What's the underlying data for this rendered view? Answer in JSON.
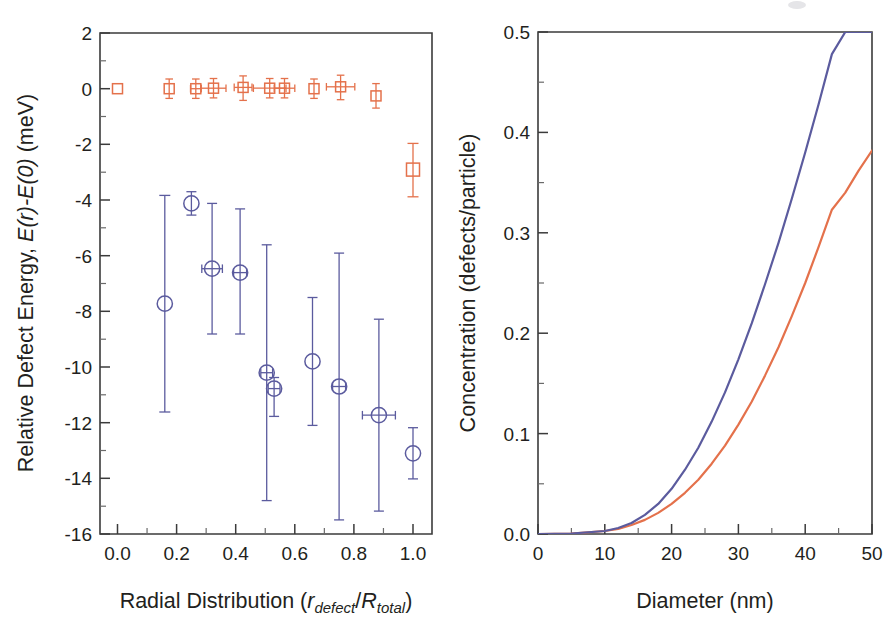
{
  "figure": {
    "panels": [
      "left",
      "right"
    ],
    "background": "#ffffff",
    "colors": {
      "blue": "#5b5b9e",
      "orange": "#e4714b",
      "axis": "#3b3b3b",
      "text": "#231f20"
    }
  },
  "left_panel": {
    "y_title_parts": {
      "a": "Relative Defect Energy, ",
      "b": "E(r)-E(0)",
      "c": " (meV)"
    },
    "x_title_parts": {
      "a": "Radial Distribution (",
      "b": "r",
      "b_sub": "defect",
      "c": "/",
      "d": "R",
      "d_sub": "total",
      "e": ")"
    },
    "y_ticks": [
      "2",
      "0",
      "-2",
      "-4",
      "-6",
      "-8",
      "-10",
      "-12",
      "-14",
      "-16"
    ],
    "x_ticks": [
      "0.0",
      "0.2",
      "0.4",
      "0.6",
      "0.8",
      "1.0"
    ]
  },
  "right_panel": {
    "y_title": "Concentration (defects/particle)",
    "x_title": "Diameter (nm)",
    "y_ticks": [
      "0.5",
      "0.4",
      "0.3",
      "0.2",
      "0.1",
      "0.0"
    ],
    "x_ticks": [
      "0",
      "10",
      "20",
      "30",
      "40",
      "50"
    ]
  },
  "chart_data": [
    {
      "type": "scatter",
      "id": "left-defect-energy",
      "title": "",
      "xlabel": "Radial Distribution (r_defect/R_total)",
      "ylabel": "Relative Defect Energy, E(r)-E(0) (meV)",
      "xlim": [
        -0.06,
        1.08
      ],
      "ylim": [
        -16,
        2
      ],
      "xticks": [
        0.0,
        0.2,
        0.4,
        0.6,
        0.8,
        1.0
      ],
      "yticks": [
        2,
        0,
        -2,
        -4,
        -6,
        -8,
        -10,
        -12,
        -14,
        -16
      ],
      "grid": false,
      "legend": "none",
      "series": [
        {
          "name": "Surface-relaxed (orange squares)",
          "color": "#e4714b",
          "marker": "square",
          "points": [
            {
              "x": 0.0,
              "y": 0.0,
              "xerr": 0.0,
              "yerr": 0.0
            },
            {
              "x": 0.175,
              "y": 0.0,
              "xerr": 0.0,
              "yerr": 0.35
            },
            {
              "x": 0.265,
              "y": 0.0,
              "xerr": 0.018,
              "yerr": 0.35
            },
            {
              "x": 0.325,
              "y": 0.02,
              "xerr": 0.042,
              "yerr": 0.35
            },
            {
              "x": 0.425,
              "y": 0.05,
              "xerr": 0.03,
              "yerr": 0.45
            },
            {
              "x": 0.515,
              "y": 0.02,
              "xerr": 0.055,
              "yerr": 0.35
            },
            {
              "x": 0.565,
              "y": 0.02,
              "xerr": 0.035,
              "yerr": 0.35
            },
            {
              "x": 0.665,
              "y": 0.0,
              "xerr": 0.012,
              "yerr": 0.35
            },
            {
              "x": 0.755,
              "y": 0.1,
              "xerr": 0.048,
              "yerr": 0.45
            },
            {
              "x": 0.875,
              "y": -0.3,
              "xerr": 0.01,
              "yerr": 0.45
            },
            {
              "x": 1.0,
              "y": -2.2,
              "xerr": 0.0,
              "yerr": 1.92
            }
          ]
        },
        {
          "name": "Unrelaxed (blue circles)",
          "color": "#5b5b9e",
          "marker": "circle",
          "points": [
            {
              "x": 0.16,
              "y": -7.3,
              "xerr": 0.0,
              "yerr": 3.9
            },
            {
              "x": 0.25,
              "y": -3.85,
              "xerr": 0.0,
              "yerr": 0.42
            },
            {
              "x": 0.32,
              "y": -6.18,
              "xerr": 0.035,
              "yerr": 2.35
            },
            {
              "x": 0.415,
              "y": -6.32,
              "xerr": 0.022,
              "yerr": 2.25
            },
            {
              "x": 0.505,
              "y": -10.68,
              "xerr": 0.02,
              "yerr": 4.6
            },
            {
              "x": 0.53,
              "y": -11.25,
              "xerr": 0.02,
              "yerr": 0.7
            },
            {
              "x": 0.66,
              "y": -10.05,
              "xerr": 0.0,
              "yerr": 2.3
            },
            {
              "x": 0.75,
              "y": -11.2,
              "xerr": 0.022,
              "yerr": 4.78
            },
            {
              "x": 0.885,
              "y": -12.2,
              "xerr": 0.055,
              "yerr": 3.45
            },
            {
              "x": 1.0,
              "y": -13.55,
              "xerr": 0.0,
              "yerr": 0.92
            }
          ]
        }
      ]
    },
    {
      "type": "line",
      "id": "right-concentration",
      "title": "",
      "xlabel": "Diameter (nm)",
      "ylabel": "Concentration (defects/particle)",
      "xlim": [
        0,
        50
      ],
      "ylim": [
        0.0,
        0.5
      ],
      "xticks": [
        0,
        10,
        20,
        30,
        40,
        50
      ],
      "yticks": [
        0.0,
        0.1,
        0.2,
        0.3,
        0.4,
        0.5
      ],
      "grid": false,
      "legend": "none",
      "x": [
        0,
        5,
        10,
        12,
        14,
        16,
        18,
        20,
        22,
        24,
        26,
        28,
        30,
        32,
        34,
        36,
        38,
        40,
        42,
        44,
        46,
        48,
        50
      ],
      "series": [
        {
          "name": "Curve A (blue)",
          "color": "#5b5b9e",
          "values": [
            0.0,
            0.0005,
            0.003,
            0.006,
            0.011,
            0.019,
            0.03,
            0.045,
            0.064,
            0.086,
            0.112,
            0.141,
            0.174,
            0.21,
            0.249,
            0.29,
            0.334,
            0.38,
            0.428,
            0.478,
            0.5,
            0.5,
            0.5
          ],
          "clipped_at_y": 0.5,
          "clip_x": 41.0
        },
        {
          "name": "Curve B (orange)",
          "color": "#e4714b",
          "values": [
            0.0,
            0.0004,
            0.003,
            0.005,
            0.009,
            0.014,
            0.021,
            0.03,
            0.041,
            0.054,
            0.07,
            0.088,
            0.109,
            0.132,
            0.158,
            0.186,
            0.217,
            0.25,
            0.286,
            0.323,
            0.34,
            0.362,
            0.382
          ]
        }
      ]
    }
  ]
}
